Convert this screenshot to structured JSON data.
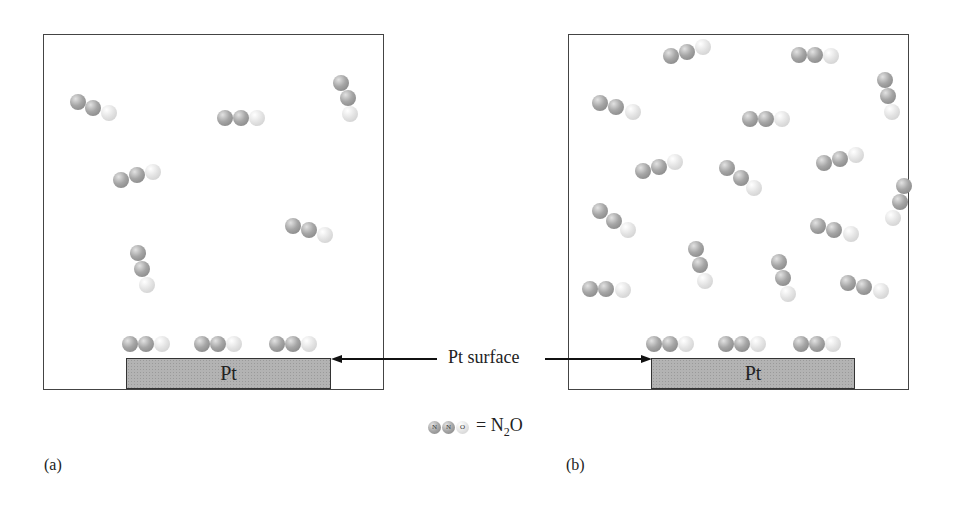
{
  "figure": {
    "panels": [
      {
        "id": "a",
        "caption": "(a)",
        "box": {
          "left": 43,
          "top": 34,
          "width": 341,
          "height": 356
        },
        "surface_label": "Pt",
        "surface": {
          "left": 126,
          "top": 358,
          "width": 205
        },
        "gas_molecules": [
          {
            "atoms": [
              [
                78,
                102
              ],
              [
                93,
                108
              ],
              [
                109,
                113
              ]
            ]
          },
          {
            "atoms": [
              [
                225,
                118
              ],
              [
                241,
                118
              ],
              [
                257,
                118
              ]
            ]
          },
          {
            "atoms": [
              [
                341,
                83
              ],
              [
                348,
                98
              ],
              [
                350,
                114
              ]
            ]
          },
          {
            "atoms": [
              [
                121,
                180
              ],
              [
                137,
                175
              ],
              [
                153,
                172
              ]
            ]
          },
          {
            "atoms": [
              [
                293,
                226
              ],
              [
                309,
                230
              ],
              [
                325,
                235
              ]
            ]
          },
          {
            "atoms": [
              [
                138,
                253
              ],
              [
                142,
                269
              ],
              [
                147,
                285
              ]
            ]
          }
        ],
        "adsorbed_molecules": [
          {
            "atoms": [
              [
                130,
                344
              ],
              [
                146,
                344
              ],
              [
                162,
                344
              ]
            ]
          },
          {
            "atoms": [
              [
                202,
                344
              ],
              [
                218,
                344
              ],
              [
                234,
                344
              ]
            ]
          },
          {
            "atoms": [
              [
                277,
                344
              ],
              [
                293,
                344
              ],
              [
                309,
                344
              ]
            ]
          }
        ]
      },
      {
        "id": "b",
        "caption": "(b)",
        "box": {
          "left": 568,
          "top": 34,
          "width": 341,
          "height": 356
        },
        "surface_label": "Pt",
        "surface": {
          "left": 651,
          "top": 358,
          "width": 204
        },
        "gas_molecules": [
          {
            "atoms": [
              [
                671,
                56
              ],
              [
                687,
                52
              ],
              [
                703,
                47
              ]
            ]
          },
          {
            "atoms": [
              [
                799,
                55
              ],
              [
                815,
                55
              ],
              [
                831,
                56
              ]
            ]
          },
          {
            "atoms": [
              [
                885,
                80
              ],
              [
                888,
                96
              ],
              [
                892,
                112
              ]
            ]
          },
          {
            "atoms": [
              [
                600,
                103
              ],
              [
                616,
                107
              ],
              [
                633,
                112
              ]
            ]
          },
          {
            "atoms": [
              [
                750,
                119
              ],
              [
                766,
                119
              ],
              [
                782,
                119
              ]
            ]
          },
          {
            "atoms": [
              [
                643,
                171
              ],
              [
                659,
                167
              ],
              [
                675,
                162
              ]
            ]
          },
          {
            "atoms": [
              [
                727,
                168
              ],
              [
                741,
                178
              ],
              [
                754,
                188
              ]
            ]
          },
          {
            "atoms": [
              [
                824,
                163
              ],
              [
                840,
                159
              ],
              [
                856,
                155
              ]
            ]
          },
          {
            "atoms": [
              [
                904,
                186
              ],
              [
                900,
                202
              ],
              [
                893,
                218
              ]
            ]
          },
          {
            "atoms": [
              [
                600,
                211
              ],
              [
                614,
                221
              ],
              [
                628,
                230
              ]
            ]
          },
          {
            "atoms": [
              [
                818,
                226
              ],
              [
                834,
                230
              ],
              [
                851,
                234
              ]
            ]
          },
          {
            "atoms": [
              [
                696,
                249
              ],
              [
                700,
                265
              ],
              [
                705,
                281
              ]
            ]
          },
          {
            "atoms": [
              [
                779,
                262
              ],
              [
                783,
                278
              ],
              [
                788,
                294
              ]
            ]
          },
          {
            "atoms": [
              [
                590,
                289
              ],
              [
                606,
                289
              ],
              [
                623,
                290
              ]
            ]
          },
          {
            "atoms": [
              [
                848,
                283
              ],
              [
                864,
                287
              ],
              [
                881,
                291
              ]
            ]
          }
        ],
        "adsorbed_molecules": [
          {
            "atoms": [
              [
                654,
                344
              ],
              [
                670,
                344
              ],
              [
                686,
                344
              ]
            ]
          },
          {
            "atoms": [
              [
                726,
                344
              ],
              [
                742,
                344
              ],
              [
                758,
                344
              ]
            ]
          },
          {
            "atoms": [
              [
                801,
                344
              ],
              [
                817,
                344
              ],
              [
                833,
                344
              ]
            ]
          }
        ]
      }
    ],
    "callout": {
      "label": "Pt surface",
      "left_arrow_target": [
        331,
        359
      ],
      "right_arrow_target": [
        651,
        359
      ]
    },
    "legend": {
      "atom_labels": [
        "N",
        "N",
        "O"
      ],
      "equals": "=",
      "formula_main": "N",
      "formula_sub": "2",
      "formula_tail": "O"
    },
    "colors": {
      "nitrogen": "#8f8f8f",
      "oxygen": "#dcdcdc",
      "platinum": "#b3b3b3",
      "border": "#444444"
    }
  }
}
